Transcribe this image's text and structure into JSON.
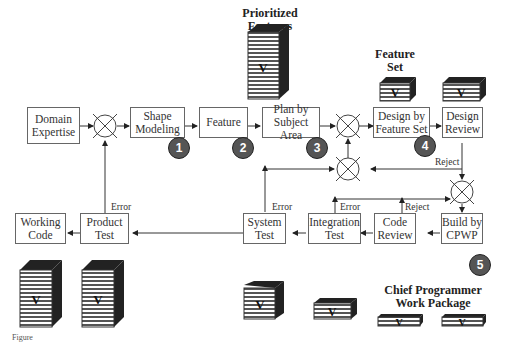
{
  "boxes": {
    "domain_expertise": "Domain Expertise",
    "shape_modeling": "Shape Modeling",
    "feature": "Feature",
    "plan_by_subject_area": "Plan by Subject Area",
    "design_by_feature_set": "Design by Feature Set",
    "design_review": "Design Review",
    "build_by_cpwp": "Build by CPWP",
    "code_review": "Code Review",
    "integration_test": "Integration Test",
    "system_test": "System Test",
    "product_test": "Product Test",
    "working_code": "Working Code"
  },
  "badges": [
    "1",
    "2",
    "3",
    "4",
    "5"
  ],
  "edge_labels": {
    "reject_design": "Reject",
    "reject_code": "Reject",
    "error_integration": "Error",
    "error_system": "Error",
    "error_product": "Error"
  },
  "titles": {
    "prioritized_features": "Prioritized Features",
    "feature_set": "Feature Set",
    "chief_programmer_work_package": "Chief Programmer Work Package"
  },
  "stack_letter": "V",
  "figure_caption": "Figure"
}
